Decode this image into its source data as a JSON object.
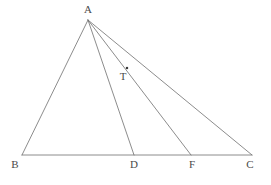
{
  "figure": {
    "kind": "geometry-diagram",
    "background_color": "#ffffff",
    "stroke_color": "#6e6e6e",
    "label_color": "#4a4a4a",
    "stroke_width": 0.8,
    "points": [
      {
        "id": "A",
        "label": "A",
        "x": 88,
        "y": 20,
        "label_x": 88,
        "label_y": 4,
        "marked": false
      },
      {
        "id": "B",
        "label": "B",
        "x": 22,
        "y": 155,
        "label_x": 15,
        "label_y": 159,
        "marked": false
      },
      {
        "id": "D",
        "label": "D",
        "x": 134,
        "y": 155,
        "label_x": 134,
        "label_y": 159,
        "marked": false
      },
      {
        "id": "F",
        "label": "F",
        "x": 191,
        "y": 155,
        "label_x": 192,
        "label_y": 159,
        "marked": false
      },
      {
        "id": "C",
        "label": "C",
        "x": 252,
        "y": 155,
        "label_x": 250,
        "label_y": 159,
        "marked": false
      },
      {
        "id": "T",
        "label": "T",
        "x": 127,
        "y": 68,
        "label_x": 123,
        "label_y": 71,
        "marked": true
      }
    ],
    "segments": [
      {
        "id": "AB",
        "from": "A",
        "to": "B"
      },
      {
        "id": "AD",
        "from": "A",
        "to": "D"
      },
      {
        "id": "AF",
        "from": "A",
        "to": "F"
      },
      {
        "id": "AC",
        "from": "A",
        "to": "C"
      },
      {
        "id": "BC",
        "from": "B",
        "to": "C"
      }
    ],
    "labels": {
      "A": "A",
      "B": "B",
      "D": "D",
      "F": "F",
      "C": "C",
      "T": "T"
    }
  }
}
